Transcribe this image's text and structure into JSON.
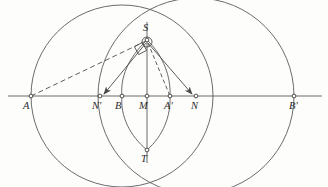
{
  "figure": {
    "type": "geometry-diagram",
    "width": 328,
    "height": 187,
    "background_color": "#fdfdfc",
    "stroke_color": "#4a4a4a",
    "label_color": "#2b2b2b"
  },
  "axis": {
    "name": "horizontal-baseline",
    "y": 96,
    "x_start": 8,
    "x_end": 322
  },
  "vertical_chord": {
    "name": "vertical-chord-ST",
    "x": 147,
    "y_start": 22,
    "y_end": 163
  },
  "points": [
    {
      "id": "A",
      "label": "A",
      "x": 31,
      "y": 96,
      "label_dx": -4,
      "label_dy": 7
    },
    {
      "id": "Np",
      "label": "N'",
      "x": 100,
      "y": 96,
      "label_dx": -5,
      "label_dy": 7
    },
    {
      "id": "B",
      "label": "B",
      "x": 122,
      "y": 96,
      "label_dx": -4,
      "label_dy": 7
    },
    {
      "id": "M",
      "label": "M",
      "x": 147,
      "y": 96,
      "label_dx": -4,
      "label_dy": 7
    },
    {
      "id": "Ap",
      "label": "A'",
      "x": 170,
      "y": 96,
      "label_dx": -4,
      "label_dy": 7
    },
    {
      "id": "N",
      "label": "N",
      "x": 196,
      "y": 96,
      "label_dx": -3,
      "label_dy": 7
    },
    {
      "id": "Bp",
      "label": "B'",
      "x": 294,
      "y": 96,
      "label_dx": -3,
      "label_dy": 7
    },
    {
      "id": "S",
      "label": "S",
      "x": 147,
      "y": 40,
      "label_dx": -4,
      "label_dy": -14
    },
    {
      "id": "T",
      "label": "T",
      "x": 147,
      "y": 150,
      "label_dx": -5,
      "label_dy": 6
    }
  ],
  "circles": [
    {
      "name": "left-circle",
      "cx": 122,
      "cy": 96,
      "r": 91,
      "style": "solid"
    },
    {
      "name": "right-circle",
      "cx": 196,
      "cy": 96,
      "r": 98,
      "style": "solid"
    }
  ],
  "lens_arcs": [
    {
      "name": "lens-arc-left",
      "from": "S",
      "to": "T",
      "through_x": 122
    },
    {
      "name": "lens-arc-right",
      "from": "S",
      "to": "T",
      "through_x": 170
    }
  ],
  "segments": [
    {
      "name": "segment-A-to-S",
      "from": "A",
      "to": "S",
      "style": "dashed",
      "arrow": false
    },
    {
      "name": "segment-S-to-Ap",
      "from": "S",
      "to": "Ap",
      "style": "dashed",
      "arrow": false
    },
    {
      "name": "segment-S-to-Np",
      "from": "S",
      "to": "Np",
      "style": "solid",
      "arrow": true
    },
    {
      "name": "segment-S-to-N",
      "from": "S",
      "to": "N",
      "style": "solid",
      "arrow": true
    }
  ],
  "markers": [
    {
      "name": "right-angle-marker-at-S",
      "x": 140,
      "y": 48,
      "size": 9,
      "rotation": -28
    },
    {
      "name": "vertex-ring-at-S",
      "cx": 147,
      "cy": 42,
      "r": 5
    }
  ]
}
